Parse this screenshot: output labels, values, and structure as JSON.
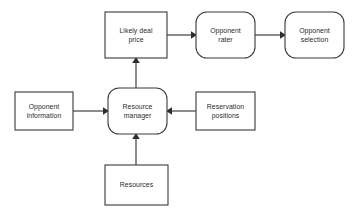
{
  "diagram": {
    "background_color": "#ffffff",
    "stroke_color": "#3a3a3a",
    "text_color": "#2b2b2b",
    "nodes": [
      {
        "id": "likely-deal-price",
        "label": "Likely deal\nprice",
        "shape": "rectangle",
        "x": 105,
        "y": 12,
        "w": 62,
        "h": 46
      },
      {
        "id": "opponent-rater",
        "label": "Opponent\nrater",
        "shape": "rounded-rectangle",
        "x": 196,
        "y": 12,
        "w": 59,
        "h": 46
      },
      {
        "id": "opponent-selection",
        "label": "Opponent\nselection",
        "shape": "rounded-rectangle",
        "x": 285,
        "y": 12,
        "w": 59,
        "h": 46
      },
      {
        "id": "opponent-information",
        "label": "Opponent\ninformation",
        "shape": "rectangle",
        "x": 15,
        "y": 92,
        "w": 58,
        "h": 38
      },
      {
        "id": "resource-manager",
        "label": "Resource\nmanager",
        "shape": "rounded-rectangle",
        "x": 108,
        "y": 88,
        "w": 59,
        "h": 46
      },
      {
        "id": "reservation-positions",
        "label": "Reservation\npositions",
        "shape": "rectangle",
        "x": 196,
        "y": 92,
        "w": 59,
        "h": 38
      },
      {
        "id": "resources",
        "label": "Resources",
        "shape": "rectangle",
        "x": 105,
        "y": 165,
        "w": 63,
        "h": 40
      }
    ],
    "edges": [
      {
        "id": "edge-price-to-rater",
        "from": "likely-deal-price",
        "to": "opponent-rater",
        "direction": "right",
        "x1": 167,
        "y1": 35,
        "x2": 196,
        "y2": 35
      },
      {
        "id": "edge-rater-to-selection",
        "from": "opponent-rater",
        "to": "opponent-selection",
        "direction": "right",
        "x1": 255,
        "y1": 35,
        "x2": 285,
        "y2": 35
      },
      {
        "id": "edge-manager-to-price",
        "from": "resource-manager",
        "to": "likely-deal-price",
        "direction": "up",
        "x1": 136,
        "y1": 88,
        "x2": 136,
        "y2": 58
      },
      {
        "id": "edge-information-to-manager",
        "from": "opponent-information",
        "to": "resource-manager",
        "direction": "right",
        "x1": 73,
        "y1": 111,
        "x2": 108,
        "y2": 111
      },
      {
        "id": "edge-reservation-to-manager",
        "from": "reservation-positions",
        "to": "resource-manager",
        "direction": "left",
        "x1": 196,
        "y1": 111,
        "x2": 167,
        "y2": 111
      },
      {
        "id": "edge-resources-to-manager",
        "from": "resources",
        "to": "resource-manager",
        "direction": "up",
        "x1": 136,
        "y1": 165,
        "x2": 136,
        "y2": 134
      }
    ]
  }
}
